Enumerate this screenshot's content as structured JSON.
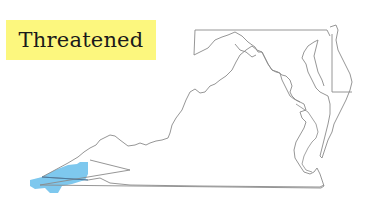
{
  "label": {
    "text": "Threatened",
    "background": "#fcf77e"
  },
  "map": {
    "regions": [
      "Virginia",
      "Maryland",
      "Delaware"
    ],
    "outline_color": "#8a8a8a",
    "range_color": "#7ec8ee",
    "range_description": "Southwestern Virginia"
  }
}
